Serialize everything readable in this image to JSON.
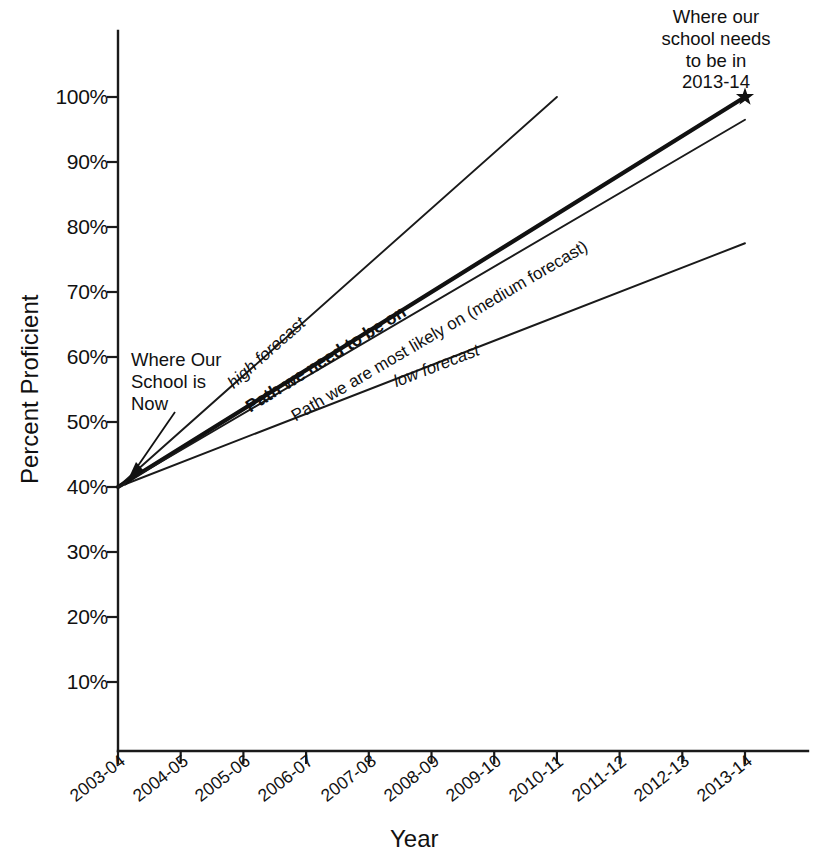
{
  "chart_data": {
    "type": "line",
    "title": "",
    "xlabel": "Year",
    "ylabel": "Percent Proficient",
    "x": [
      "2003-04",
      "2004-05",
      "2005-06",
      "2006-07",
      "2007-08",
      "2008-09",
      "2009-10",
      "2010-11",
      "2011-12",
      "2012-13",
      "2013-14"
    ],
    "ytick_labels": [
      "100%",
      "90%",
      "80%",
      "70%",
      "60%",
      "50%",
      "40%",
      "30%",
      "20%",
      "10%"
    ],
    "ytick_values": [
      100,
      90,
      80,
      70,
      60,
      50,
      40,
      30,
      20,
      10
    ],
    "ylim": [
      0,
      108
    ],
    "xlim": [
      "2003-04",
      "2013-14"
    ],
    "grid": false,
    "legend_position": "inline-labels",
    "series": [
      {
        "name": "high forecast",
        "style": "thin",
        "label": "high forecast",
        "label_style": "italic",
        "x": [
          "2003-04",
          "2010-11"
        ],
        "values": [
          40,
          100
        ]
      },
      {
        "name": "Path we need to be on",
        "style": "bold",
        "label": "Path we need to be on",
        "label_style": "bold",
        "x": [
          "2003-04",
          "2013-14"
        ],
        "values": [
          40,
          100
        ]
      },
      {
        "name": "Path we are most likely on (medium forecast)",
        "style": "thin",
        "label": "Path we are most likely on (medium forecast)",
        "label_style": "regular",
        "x": [
          "2003-04",
          "2013-14"
        ],
        "values": [
          40,
          96.5
        ]
      },
      {
        "name": "low forecast",
        "style": "thin",
        "label": "low forecast",
        "label_style": "italic",
        "x": [
          "2003-04",
          "2013-14"
        ],
        "values": [
          40,
          77.5
        ]
      }
    ],
    "annotations": [
      {
        "name": "where-our-school-is-now",
        "lines": [
          "Where Our",
          "School is",
          "Now"
        ],
        "points_to": {
          "x": "2003-04",
          "y": 40
        },
        "arrow": true
      },
      {
        "name": "where-our-school-needs-to-be",
        "lines": [
          "Where our",
          "school needs",
          "to be in",
          "2013-14"
        ],
        "points_to": {
          "x": "2013-14",
          "y": 100
        },
        "marker": "star"
      }
    ],
    "markers": [
      {
        "name": "goal-star",
        "x": "2013-14",
        "y": 100,
        "shape": "star"
      }
    ]
  },
  "annotation_now": {
    "line1": "Where Our",
    "line2": "School is",
    "line3": "Now"
  },
  "annotation_goal": {
    "line1": "Where our",
    "line2": "school needs",
    "line3": "to be in",
    "line4": "2013-14"
  },
  "labels": {
    "high": "high forecast",
    "need": "Path we need to be on",
    "medium": "Path we are most likely on (medium forecast)",
    "low": "low forecast"
  },
  "axes": {
    "x_title": "Year",
    "y_title": "Percent Proficient"
  },
  "colors": {
    "ink": "#111111",
    "background": "#ffffff"
  }
}
